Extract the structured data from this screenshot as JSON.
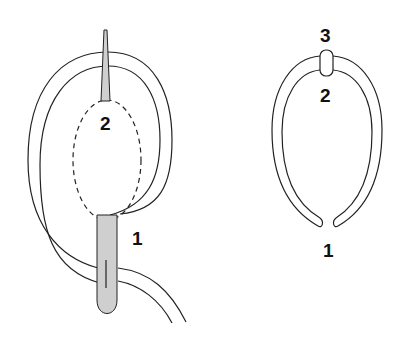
{
  "figure": {
    "left_diagram": {
      "labels": {
        "two": "2",
        "one": "1"
      },
      "parts": [
        "needle-tip",
        "thread-loop",
        "dashed-loop",
        "knot-body"
      ]
    },
    "right_diagram": {
      "labels": {
        "three": "3",
        "two": "2",
        "one": "1"
      },
      "parts": [
        "open-ring",
        "clip"
      ]
    },
    "colors": {
      "stroke": "#222222",
      "fill_gray": "#cfcfcf",
      "background": "#ffffff"
    }
  }
}
